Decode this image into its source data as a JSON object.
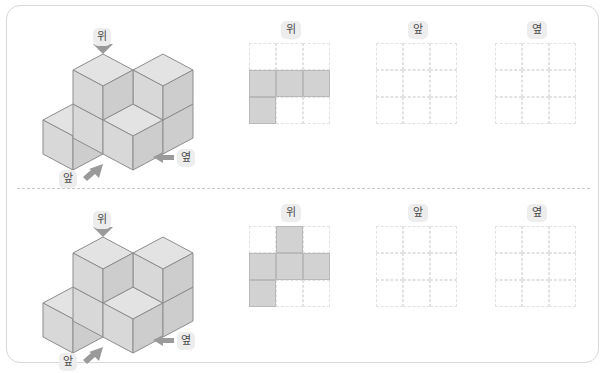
{
  "worksheet": {
    "background_color": "#ffffff",
    "border_color": "#d9d9d9",
    "divider_style": "dashed",
    "filled_cell_color": "#d2d2d2",
    "grid_line_color": "#e2e2e2",
    "cube_face_colors": {
      "top": "#e3e3e3",
      "left": "#d4d4d4",
      "right": "#c9c9c9",
      "edge": "#8d8d8d"
    },
    "label_chip_color": "#ededed",
    "label_text_color": "#4a4a4a",
    "arrow_color": "#9a9a9a"
  },
  "labels": {
    "top": "위",
    "front": "앞",
    "side": "옆"
  },
  "problems": [
    {
      "id": "problem-1",
      "solid": {
        "description": "isometric stack of cubes",
        "cubes": [
          {
            "x": 0,
            "y": 1,
            "z": 0
          },
          {
            "x": 1,
            "y": 0,
            "z": 0
          },
          {
            "x": 1,
            "y": 1,
            "z": 0
          },
          {
            "x": 2,
            "y": 0,
            "z": 0
          },
          {
            "x": 1,
            "y": 0,
            "z": 1
          }
        ]
      },
      "direction_arrows": [
        {
          "name": "top",
          "label": "위",
          "arrow": "down"
        },
        {
          "name": "front",
          "label": "앞",
          "arrow": "up-right"
        },
        {
          "name": "side",
          "label": "옆",
          "arrow": "left"
        }
      ],
      "views": [
        {
          "name": "top-view",
          "title": "위",
          "filled": [
            [
              0,
              0,
              0
            ],
            [
              1,
              1,
              1
            ],
            [
              1,
              0,
              0
            ]
          ]
        },
        {
          "name": "front-view",
          "title": "앞",
          "filled": [
            [
              0,
              0,
              0
            ],
            [
              0,
              0,
              0
            ],
            [
              0,
              0,
              0
            ]
          ]
        },
        {
          "name": "side-view",
          "title": "옆",
          "filled": [
            [
              0,
              0,
              0
            ],
            [
              0,
              0,
              0
            ],
            [
              0,
              0,
              0
            ]
          ]
        }
      ]
    },
    {
      "id": "problem-2",
      "solid": {
        "description": "isometric stack of cubes",
        "cubes": [
          {
            "x": 0,
            "y": 1,
            "z": 0
          },
          {
            "x": 1,
            "y": 0,
            "z": 0
          },
          {
            "x": 1,
            "y": 1,
            "z": 0
          },
          {
            "x": 2,
            "y": 0,
            "z": 0
          },
          {
            "x": 1,
            "y": 0,
            "z": 1
          }
        ]
      },
      "direction_arrows": [
        {
          "name": "top",
          "label": "위",
          "arrow": "down"
        },
        {
          "name": "front",
          "label": "앞",
          "arrow": "up-right"
        },
        {
          "name": "side",
          "label": "옆",
          "arrow": "left"
        }
      ],
      "views": [
        {
          "name": "top-view",
          "title": "위",
          "filled": [
            [
              0,
              1,
              0
            ],
            [
              1,
              1,
              1
            ],
            [
              1,
              0,
              0
            ]
          ]
        },
        {
          "name": "front-view",
          "title": "앞",
          "filled": [
            [
              0,
              0,
              0
            ],
            [
              0,
              0,
              0
            ],
            [
              0,
              0,
              0
            ]
          ]
        },
        {
          "name": "side-view",
          "title": "옆",
          "filled": [
            [
              0,
              0,
              0
            ],
            [
              0,
              0,
              0
            ],
            [
              0,
              0,
              0
            ]
          ]
        }
      ]
    }
  ]
}
